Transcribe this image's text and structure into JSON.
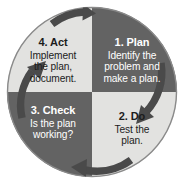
{
  "figure": {
    "name": "PDCA cycle diagram",
    "shape": "circle divided into four quadrants with curved cycle arrows",
    "center": {
      "x": 92,
      "y": 92
    },
    "radius": 85
  },
  "colors": {
    "background": "#ffffff",
    "dark_quadrant": "#636363",
    "light_quadrant": "#e2e2e0",
    "dark_text": "#1c1c1c",
    "light_text": "#ffffff",
    "arrow": "#4a4a4a",
    "circle_outline": "#8a8a8a"
  },
  "quadrants": [
    {
      "id": "plan",
      "position": "top-right",
      "title": "1. Plan",
      "body": "Identify the problem and make a plan.",
      "body_lines": [
        "Identify the",
        "problem and",
        "make a plan."
      ],
      "fill": "dark",
      "text_color": "light"
    },
    {
      "id": "do",
      "position": "bottom-right",
      "title": "2. Do",
      "body": "Test the plan.",
      "body_lines": [
        "Test the",
        "plan."
      ],
      "fill": "light",
      "text_color": "dark"
    },
    {
      "id": "check",
      "position": "bottom-left",
      "title": "3. Check",
      "body": "Is the plan working?",
      "body_lines": [
        "Is the plan",
        "working?"
      ],
      "fill": "dark",
      "text_color": "light"
    },
    {
      "id": "act",
      "position": "top-left",
      "title": "4. Act",
      "body": "Implement the plan, document.",
      "body_lines": [
        "Implement",
        "the plan,",
        "document."
      ],
      "fill": "light",
      "text_color": "dark"
    }
  ],
  "arrows": [
    {
      "id": "arrow-top",
      "from": "act",
      "to": "plan",
      "direction": "clockwise",
      "points": "right"
    },
    {
      "id": "arrow-right",
      "from": "plan",
      "to": "do",
      "direction": "clockwise",
      "points": "down"
    },
    {
      "id": "arrow-bottom",
      "from": "do",
      "to": "check",
      "direction": "clockwise",
      "points": "left"
    },
    {
      "id": "arrow-left",
      "from": "check",
      "to": "act",
      "direction": "clockwise",
      "points": "up"
    }
  ]
}
